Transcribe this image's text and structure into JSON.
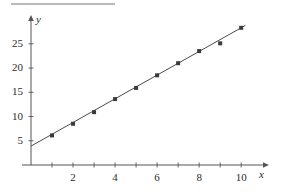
{
  "chart_data": {
    "type": "scatter",
    "title": "",
    "subtitle": "",
    "xlabel": "x",
    "ylabel": "y",
    "x": [
      1,
      2,
      3,
      4,
      5,
      6,
      7,
      8,
      9,
      10
    ],
    "values": [
      6.1,
      8.5,
      10.9,
      13.6,
      15.9,
      18.5,
      21.0,
      23.5,
      25.1,
      28.3
    ],
    "series": [
      {
        "name": "data points",
        "x": [
          1,
          2,
          3,
          4,
          5,
          6,
          7,
          8,
          9,
          10
        ],
        "values": [
          6.1,
          8.5,
          10.9,
          13.6,
          15.9,
          18.5,
          21.0,
          23.5,
          25.1,
          28.3
        ]
      },
      {
        "name": "fitted line",
        "type": "line",
        "intercept": 3.9,
        "slope": 2.44,
        "x": [
          0,
          10.2
        ],
        "values": [
          3.9,
          28.8
        ]
      }
    ],
    "xlim": [
      0,
      10.8
    ],
    "ylim": [
      0,
      29.5
    ],
    "xticks": [
      2,
      4,
      6,
      8,
      10
    ],
    "xtick_labels": [
      "2",
      "4",
      "6",
      "8",
      "10"
    ],
    "xminor_ticks": [
      1,
      2,
      3,
      4,
      5,
      6,
      7,
      8,
      9,
      10
    ],
    "yticks": [
      5,
      10,
      15,
      20,
      25
    ],
    "ytick_labels": [
      "5",
      "10",
      "15",
      "20",
      "25"
    ],
    "grid": false,
    "legend": "none",
    "marker": "filled-square",
    "marker_color": "#3a3a3a",
    "line_color": "#4a4a4a",
    "axis_color": "#555555"
  },
  "axes": {
    "x_axis_name": "x",
    "y_axis_name": "y"
  }
}
